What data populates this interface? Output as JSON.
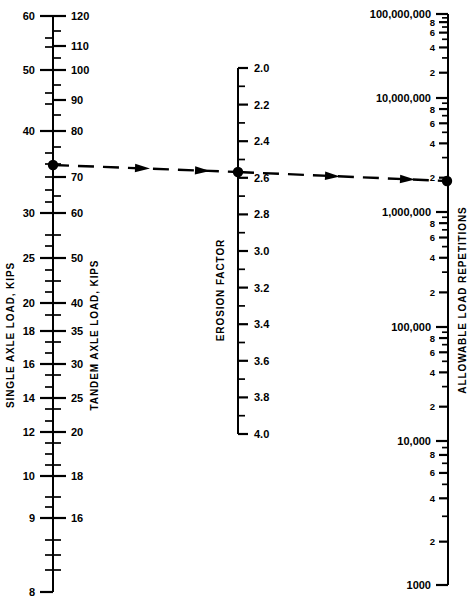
{
  "figure": {
    "type": "nomograph",
    "background_color": "#ffffff",
    "ink_color": "#000000"
  },
  "chart_data": {
    "type": "line",
    "title": "",
    "subtitle": "",
    "xlabel": "",
    "ylabel": "",
    "grid": false,
    "legend": "none",
    "axes": [
      {
        "id": "single-axle",
        "label": "SINGLE AXLE LOAD, KIPS",
        "label_orientation": "vertical",
        "side": "left",
        "range": [
          8,
          60
        ],
        "scale": "nonlinear",
        "major_labels": [
          "60",
          "50",
          "40",
          "30",
          "25",
          "20",
          "18",
          "16",
          "14",
          "12",
          "10",
          "9",
          "8"
        ],
        "major_values": [
          60,
          50,
          40,
          30,
          25,
          20,
          18,
          16,
          14,
          12,
          10,
          9,
          8
        ],
        "major_y": [
          16,
          70,
          131,
          213,
          258,
          303,
          331,
          364,
          398,
          432,
          476,
          518,
          592
        ],
        "minor_y": [
          38,
          47,
          93,
          104,
          153,
          164,
          177,
          190,
          202,
          235,
          246,
          270,
          281,
          292,
          315,
          342,
          353,
          375,
          387,
          409,
          421,
          443,
          454,
          465,
          497,
          507,
          540,
          555,
          570
        ]
      },
      {
        "id": "tandem-axle",
        "label": "TANDEM AXLE LOAD, KIPS",
        "label_orientation": "vertical",
        "side": "right",
        "range": [
          16,
          120
        ],
        "scale": "nonlinear",
        "major_labels": [
          "120",
          "110",
          "100",
          "90",
          "80",
          "70",
          "60",
          "50",
          "40",
          "35",
          "30",
          "25",
          "20",
          "18",
          "16"
        ],
        "major_values": [
          120,
          110,
          100,
          90,
          80,
          70,
          60,
          50,
          40,
          35,
          30,
          25,
          20,
          18,
          16
        ],
        "major_y": [
          16,
          46,
          70,
          100,
          131,
          177,
          213,
          258,
          303,
          331,
          364,
          398,
          432,
          476,
          518,
          592
        ],
        "minor_y": [
          31,
          58,
          85,
          115,
          147,
          164,
          196,
          235,
          281,
          315,
          342,
          375,
          409,
          443,
          465,
          497,
          540,
          555,
          570
        ]
      },
      {
        "id": "erosion-factor",
        "label": "EROSION FACTOR",
        "label_orientation": "vertical",
        "side": "right",
        "range": [
          2.0,
          4.0
        ],
        "scale": "linear",
        "major_labels": [
          "2.0",
          "2.2",
          "2.4",
          "2.6",
          "2.8",
          "3.0",
          "3.2",
          "3.4",
          "3.6",
          "3.8",
          "4.0"
        ],
        "major_values": [
          2.0,
          2.2,
          2.4,
          2.6,
          2.8,
          3.0,
          3.2,
          3.4,
          3.6,
          3.8,
          4.0
        ],
        "top_y": 68,
        "bottom_y": 434,
        "minor_count_between": 1
      },
      {
        "id": "allowable-load-repetitions",
        "label": "ALLOWABLE LOAD REPETITIONS",
        "label_orientation": "vertical",
        "side": "right",
        "range": [
          1000,
          100000000
        ],
        "scale": "log",
        "decade_labels": [
          "100,000,000",
          "10,000,000",
          "1,000,000",
          "100,000",
          "10,000",
          "1000"
        ],
        "decade_values": [
          100000000,
          10000000,
          1000000,
          100000,
          10000,
          1000
        ],
        "decade_y": [
          14,
          98,
          212,
          327,
          441,
          585
        ],
        "minor_labels": [
          "8",
          "6",
          "4",
          "2"
        ],
        "minor_values": [
          8,
          6,
          4,
          2
        ]
      }
    ],
    "solution_line": {
      "style": "dashed-with-arrowheads",
      "points": [
        {
          "axis": "tandem-axle",
          "value": 70,
          "x": 53,
          "y": 165
        },
        {
          "axis": "erosion-factor",
          "value": 2.6,
          "x": 238,
          "y": 172
        },
        {
          "axis": "allowable-load-repetitions",
          "value": 2000000,
          "x": 447,
          "y": 181
        }
      ],
      "arrow_positions": [
        {
          "x": 150,
          "y": 168.6
        },
        {
          "x": 210,
          "y": 170.9
        },
        {
          "x": 340,
          "y": 176.4
        },
        {
          "x": 415,
          "y": 179.6
        }
      ],
      "pivot_markers": [
        {
          "x": 53,
          "y": 165
        },
        {
          "x": 238,
          "y": 172
        },
        {
          "x": 447,
          "y": 181
        }
      ]
    }
  }
}
